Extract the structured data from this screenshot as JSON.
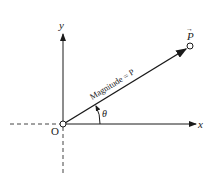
{
  "diagram": {
    "axes": {
      "x_label": "x",
      "y_label": "y",
      "origin_label": "O"
    },
    "vector": {
      "name": "P",
      "arrow_marker": "→",
      "magnitude_label": "Magnitude = P",
      "angle_label": "θ"
    },
    "colors": {
      "line": "#1a1a1a",
      "background": "#ffffff"
    }
  }
}
